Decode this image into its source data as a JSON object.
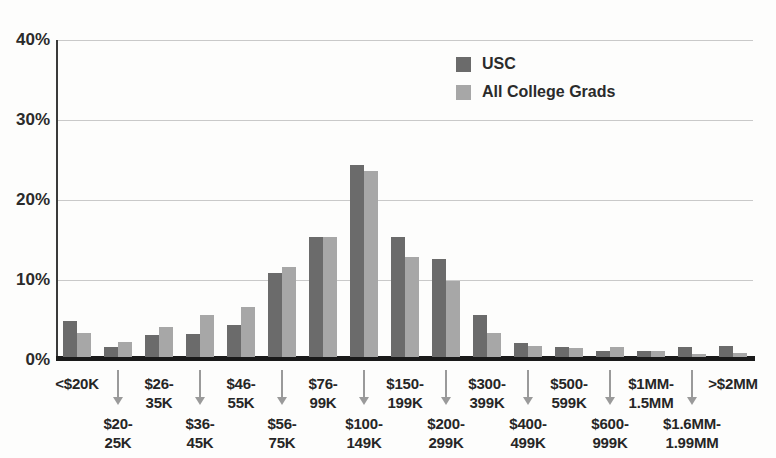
{
  "chart_data": {
    "type": "bar",
    "title": "",
    "xlabel": "",
    "ylabel": "",
    "ylim": [
      0,
      40
    ],
    "yticks": [
      {
        "value": 0,
        "label": "0%"
      },
      {
        "value": 10,
        "label": "10%"
      },
      {
        "value": 20,
        "label": "20%"
      },
      {
        "value": 30,
        "label": "30%"
      },
      {
        "value": 40,
        "label": "40%"
      }
    ],
    "grid": "horizontal",
    "legend_position": "top-right",
    "categories": [
      "<$20K",
      "$20-25K",
      "$26-35K",
      "$36-45K",
      "$46-55K",
      "$56-75K",
      "$76-99K",
      "$100-149K",
      "$150-199K",
      "$200-299K",
      "$300-399K",
      "$400-499K",
      "$500-599K",
      "$600-999K",
      "$1MM-1.5MM",
      "$1.6MM-1.99MM",
      ">$2MM"
    ],
    "series": [
      {
        "name": "USC",
        "color": "#6b6b6b",
        "values": [
          4.5,
          1.2,
          2.7,
          2.9,
          4.0,
          10.5,
          15.0,
          24.0,
          15.0,
          12.2,
          5.3,
          1.8,
          1.3,
          0.7,
          0.8,
          1.2,
          1.4
        ]
      },
      {
        "name": "All College Grads",
        "color": "#a7a7a7",
        "values": [
          3.0,
          1.9,
          3.8,
          5.2,
          6.2,
          11.2,
          15.0,
          23.3,
          12.5,
          9.5,
          3.0,
          1.4,
          1.1,
          1.3,
          0.7,
          0.4,
          0.5
        ]
      }
    ],
    "x_labels_display": [
      {
        "text": "<$20K",
        "row": "top"
      },
      {
        "text": "$20-\n25K",
        "row": "bottom"
      },
      {
        "text": "$26-\n35K",
        "row": "top"
      },
      {
        "text": "$36-\n45K",
        "row": "bottom"
      },
      {
        "text": "$46-\n55K",
        "row": "top"
      },
      {
        "text": "$56-\n75K",
        "row": "bottom"
      },
      {
        "text": "$76-\n99K",
        "row": "top"
      },
      {
        "text": "$100-\n149K",
        "row": "bottom"
      },
      {
        "text": "$150-\n199K",
        "row": "top"
      },
      {
        "text": "$200-\n299K",
        "row": "bottom"
      },
      {
        "text": "$300-\n399K",
        "row": "top"
      },
      {
        "text": "$400-\n499K",
        "row": "bottom"
      },
      {
        "text": "$500-\n599K",
        "row": "top"
      },
      {
        "text": "$600-\n999K",
        "row": "bottom"
      },
      {
        "text": "$1MM-\n1.5MM",
        "row": "top"
      },
      {
        "text": "$1.6MM-\n1.99MM",
        "row": "bottom"
      },
      {
        "text": ">$2MM",
        "row": "top"
      }
    ],
    "colors": {
      "gridline": "#c9c9c9",
      "baseline": "#1a1a1a",
      "y_axis": "#3a3a3a",
      "arrow": "#9a9a9a",
      "text": "#2b2b2b"
    }
  },
  "legend": {
    "items": [
      {
        "label": "USC"
      },
      {
        "label": "All College Grads"
      }
    ]
  }
}
